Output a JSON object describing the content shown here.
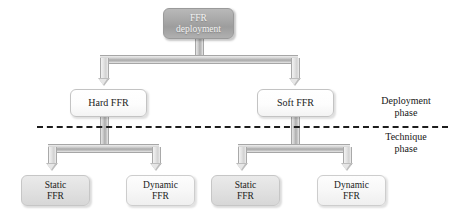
{
  "diagram": {
    "background_color": "#ffffff",
    "root": {
      "id": "ffr-deployment",
      "label": "FFR\ndeployment",
      "line1": "FFR",
      "line2": "deployment",
      "style": "dark-grey-white-text",
      "fill": "#a8a8a8",
      "text_color": "#f2f2f2"
    },
    "level2": [
      {
        "id": "hard-ffr",
        "label": "Hard FFR",
        "style": "white",
        "fill": "#ffffff",
        "text_color": "#1b1b1b"
      },
      {
        "id": "soft-ffr",
        "label": "Soft FFR",
        "style": "white",
        "fill": "#ffffff",
        "text_color": "#1b1b1b"
      }
    ],
    "level3": [
      {
        "id": "hard-static-ffr",
        "parent": "hard-ffr",
        "line1": "Static",
        "line2": "FFR",
        "label": "Static FFR",
        "style": "grey",
        "fill": "#e2e2e2",
        "text_color": "#1b1b1b"
      },
      {
        "id": "hard-dynamic-ffr",
        "parent": "hard-ffr",
        "line1": "Dynamic",
        "line2": "FFR",
        "label": "Dynamic FFR",
        "style": "pale",
        "fill": "#f8f8f8",
        "text_color": "#1b1b1b"
      },
      {
        "id": "soft-static-ffr",
        "parent": "soft-ffr",
        "line1": "Static",
        "line2": "FFR",
        "label": "Static FFR",
        "style": "grey",
        "fill": "#e2e2e2",
        "text_color": "#1b1b1b"
      },
      {
        "id": "soft-dynamic-ffr",
        "parent": "soft-ffr",
        "line1": "Dynamic",
        "line2": "FFR",
        "label": "Dynamic FFR",
        "style": "pale",
        "fill": "#f8f8f8",
        "text_color": "#1b1b1b"
      }
    ],
    "phases": {
      "divider_style": "dashed",
      "divider_color": "#1d1d1d",
      "above": {
        "id": "deployment-phase",
        "line1": "Deployment",
        "line2": "phase",
        "label": "Deployment phase"
      },
      "below": {
        "id": "technique-phase",
        "line1": "Technique",
        "line2": "phase",
        "label": "Technique phase"
      }
    }
  }
}
